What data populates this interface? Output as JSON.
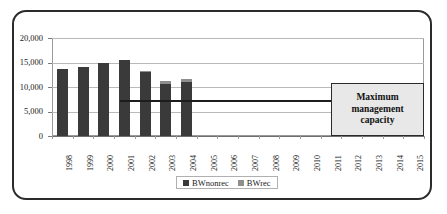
{
  "chart_data": {
    "type": "bar",
    "subtype": "stacked-bar-with-threshold-line",
    "title": "",
    "xlabel": "",
    "ylabel": "",
    "ylim": [
      0,
      20000
    ],
    "yticks": [
      "0",
      "5,000",
      "10,000",
      "15,000",
      "20,000"
    ],
    "ytick_values": [
      0,
      5000,
      10000,
      15000,
      20000
    ],
    "grid": true,
    "categories": [
      "1998",
      "1999",
      "2000",
      "2001",
      "2002",
      "2003",
      "2004",
      "2005",
      "2006",
      "2007",
      "2008",
      "2009",
      "2010",
      "2011",
      "2012",
      "2013",
      "2014",
      "2015"
    ],
    "series": [
      {
        "name": "BWnonrec",
        "color": "#3a3a3a",
        "values": [
          13600,
          14100,
          14900,
          15500,
          13000,
          10600,
          11000,
          null,
          null,
          null,
          null,
          null,
          null,
          null,
          null,
          null,
          null,
          null
        ]
      },
      {
        "name": "BWrec",
        "color": "#8e8e8e",
        "values": [
          0,
          0,
          0,
          0,
          200,
          600,
          600,
          null,
          null,
          null,
          null,
          null,
          null,
          null,
          null,
          null,
          null,
          null
        ]
      }
    ],
    "totals": [
      13600,
      14100,
      14900,
      15500,
      13200,
      11200,
      11600,
      null,
      null,
      null,
      null,
      null,
      null,
      null,
      null,
      null,
      null,
      null
    ],
    "legend": {
      "position": "bottom",
      "entries": [
        {
          "label": "BWnonrec",
          "color": "#3a3a3a"
        },
        {
          "label": "BWrec",
          "color": "#8e8e8e"
        }
      ]
    },
    "annotations": [
      {
        "type": "threshold-line",
        "label": "Maximum management capacity",
        "value": 7200,
        "start_category": "2001",
        "end_category": "2015",
        "color": "#1d1d1d"
      }
    ],
    "callout": {
      "text": "Maximum management capacity",
      "line1": "Maximum",
      "line2": "management",
      "line3": "capacity",
      "fill": "#e8e8e8",
      "border": "#2b2b2b"
    }
  },
  "legend": {
    "entries": [
      {
        "label": "BWnonrec"
      },
      {
        "label": "BWrec"
      }
    ]
  }
}
